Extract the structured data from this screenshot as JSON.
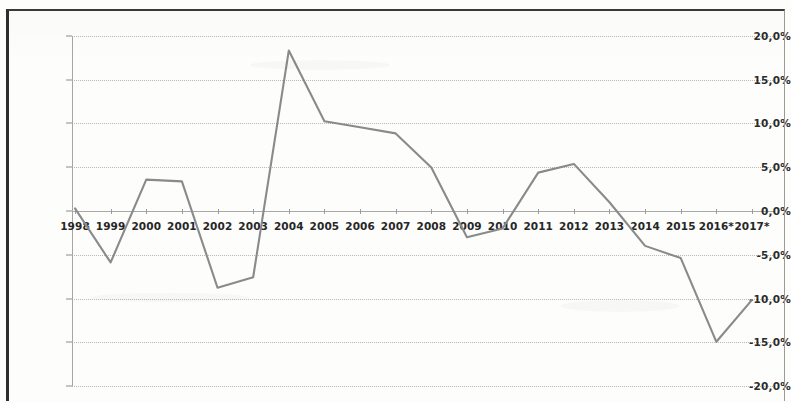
{
  "chart_data": {
    "type": "line",
    "title": "",
    "subtitle": "",
    "xlabel": "",
    "ylabel": "",
    "categories": [
      "1998",
      "1999",
      "2000",
      "2001",
      "2002",
      "2003",
      "2004",
      "2005",
      "2006",
      "2007",
      "2008",
      "2009",
      "2010",
      "2011",
      "2012",
      "2013",
      "2014",
      "2015",
      "2016*",
      "2017*"
    ],
    "values": [
      0.3,
      -5.9,
      3.6,
      3.4,
      -8.8,
      -7.6,
      18.4,
      10.3,
      9.6,
      8.9,
      5.0,
      -3.0,
      -2.0,
      4.4,
      5.4,
      1.0,
      -4.0,
      -5.4,
      -15.0,
      -10.2
    ],
    "series": [
      {
        "name": "",
        "values": [
          0.3,
          -5.9,
          3.6,
          3.4,
          -8.8,
          -7.6,
          18.4,
          10.3,
          9.6,
          8.9,
          5.0,
          -3.0,
          -2.0,
          4.4,
          5.4,
          1.0,
          -4.0,
          -5.4,
          -15.0,
          -10.2
        ]
      }
    ],
    "ylim": [
      -20,
      20
    ],
    "y_ticks": [
      20,
      15,
      10,
      5,
      0,
      -5,
      -10,
      -15,
      -20
    ],
    "y_tick_labels": [
      "20,0%",
      "15,0%",
      "10,0%",
      "5,0%",
      "0,0%",
      "-5,0%",
      "-10,0%",
      "-15,0%",
      "-20,0%"
    ],
    "grid": true,
    "legend": "none",
    "line_color": "#8a8a8a",
    "grid_color": "#b9b9b9",
    "axis_color": "#a6a6a6",
    "note": "* marks forecast years",
    "value_format": "percent",
    "decimal_separator": ","
  },
  "axes": {
    "y_tick_labels": [
      "20,0%",
      "15,0%",
      "10,0%",
      "5,0%",
      "0,0%",
      "-5,0%",
      "-10,0%",
      "-15,0%",
      "-20,0%"
    ],
    "x_tick_labels": [
      "1998",
      "1999",
      "2000",
      "2001",
      "2002",
      "2003",
      "2004",
      "2005",
      "2006",
      "2007",
      "2008",
      "2009",
      "2010",
      "2011",
      "2012",
      "2013",
      "2014",
      "2015",
      "2016*",
      "2017*"
    ]
  }
}
